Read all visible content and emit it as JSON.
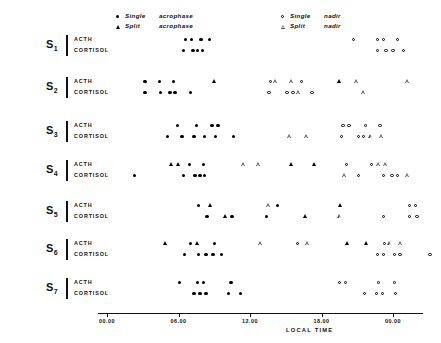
{
  "chart_data": {
    "type": "scatter",
    "title": "",
    "xlabel": "LOCAL TIME",
    "ylabel": "",
    "grid": false,
    "xlim": [
      0,
      30
    ],
    "x_ticks": [
      {
        "value": 0,
        "label": "00.00"
      },
      {
        "value": 6,
        "label": "06.00"
      },
      {
        "value": 12,
        "label": "12.00"
      },
      {
        "value": 18,
        "label": "18.00"
      },
      {
        "value": 24,
        "label": "00.00"
      }
    ],
    "legend": {
      "position": "top",
      "entries": [
        {
          "marker": "filled-circle",
          "kind": "Single",
          "type": "acrophase"
        },
        {
          "marker": "filled-triangle",
          "kind": "Split",
          "type": "acrophase"
        },
        {
          "marker": "open-circle",
          "kind": "Single",
          "type": "nadir"
        },
        {
          "marker": "open-triangle",
          "kind": "Split",
          "type": "nadir"
        }
      ]
    },
    "subjects": [
      {
        "id": "S1",
        "label": "S",
        "index": "1",
        "rows": [
          {
            "name": "ACTH",
            "points": [
              {
                "x": 6.6,
                "marker": "filled-circle"
              },
              {
                "x": 7.1,
                "marker": "filled-circle"
              },
              {
                "x": 7.9,
                "marker": "filled-circle"
              },
              {
                "x": 8.6,
                "marker": "filled-circle"
              },
              {
                "x": 20.7,
                "marker": "open-circle"
              },
              {
                "x": 22.7,
                "marker": "open-circle"
              },
              {
                "x": 23.2,
                "marker": "open-circle"
              },
              {
                "x": 24.4,
                "marker": "open-circle"
              }
            ]
          },
          {
            "name": "CORTISOL",
            "points": [
              {
                "x": 6.4,
                "marker": "filled-circle"
              },
              {
                "x": 7.2,
                "marker": "filled-circle"
              },
              {
                "x": 7.6,
                "marker": "filled-circle"
              },
              {
                "x": 8.0,
                "marker": "filled-circle"
              },
              {
                "x": 22.7,
                "marker": "open-circle"
              },
              {
                "x": 23.4,
                "marker": "open-circle"
              },
              {
                "x": 24.0,
                "marker": "open-circle"
              },
              {
                "x": 24.9,
                "marker": "open-circle"
              }
            ]
          }
        ]
      },
      {
        "id": "S2",
        "label": "S",
        "index": "2",
        "rows": [
          {
            "name": "ACTH",
            "points": [
              {
                "x": 3.2,
                "marker": "filled-circle"
              },
              {
                "x": 4.4,
                "marker": "filled-circle"
              },
              {
                "x": 5.6,
                "marker": "filled-circle"
              },
              {
                "x": 9.0,
                "marker": "filled-triangle"
              },
              {
                "x": 13.7,
                "marker": "open-circle"
              },
              {
                "x": 14.2,
                "marker": "open-triangle"
              },
              {
                "x": 15.5,
                "marker": "open-triangle"
              },
              {
                "x": 16.3,
                "marker": "open-circle"
              },
              {
                "x": 19.5,
                "marker": "filled-triangle"
              },
              {
                "x": 21.0,
                "marker": "open-triangle"
              },
              {
                "x": 25.3,
                "marker": "open-triangle"
              }
            ]
          },
          {
            "name": "CORTISOL",
            "points": [
              {
                "x": 3.2,
                "marker": "filled-circle"
              },
              {
                "x": 4.5,
                "marker": "filled-circle"
              },
              {
                "x": 5.3,
                "marker": "filled-circle"
              },
              {
                "x": 5.7,
                "marker": "filled-circle"
              },
              {
                "x": 7.0,
                "marker": "filled-circle"
              },
              {
                "x": 13.6,
                "marker": "open-circle"
              },
              {
                "x": 15.1,
                "marker": "open-circle"
              },
              {
                "x": 15.6,
                "marker": "open-circle"
              },
              {
                "x": 16.1,
                "marker": "open-triangle"
              },
              {
                "x": 17.2,
                "marker": "open-circle"
              },
              {
                "x": 21.6,
                "marker": "open-triangle"
              }
            ]
          }
        ]
      },
      {
        "id": "S3",
        "label": "S",
        "index": "3",
        "rows": [
          {
            "name": "ACTH",
            "points": [
              {
                "x": 5.9,
                "marker": "filled-circle"
              },
              {
                "x": 7.5,
                "marker": "filled-circle"
              },
              {
                "x": 8.8,
                "marker": "filled-circle"
              },
              {
                "x": 9.3,
                "marker": "filled-circle"
              },
              {
                "x": 19.8,
                "marker": "open-circle"
              },
              {
                "x": 20.3,
                "marker": "open-circle"
              },
              {
                "x": 21.7,
                "marker": "open-circle"
              },
              {
                "x": 22.9,
                "marker": "open-circle"
              }
            ]
          },
          {
            "name": "CORTISOL",
            "points": [
              {
                "x": 5.1,
                "marker": "filled-circle"
              },
              {
                "x": 6.3,
                "marker": "filled-circle"
              },
              {
                "x": 7.3,
                "marker": "filled-circle"
              },
              {
                "x": 8.2,
                "marker": "filled-circle"
              },
              {
                "x": 9.1,
                "marker": "filled-circle"
              },
              {
                "x": 10.6,
                "marker": "filled-circle"
              },
              {
                "x": 15.4,
                "marker": "open-triangle"
              },
              {
                "x": 16.8,
                "marker": "open-triangle"
              },
              {
                "x": 19.7,
                "marker": "open-circle"
              },
              {
                "x": 21.1,
                "marker": "open-circle"
              },
              {
                "x": 21.5,
                "marker": "open-circle"
              },
              {
                "x": 22.2,
                "marker": "open-triangle"
              },
              {
                "x": 23.1,
                "marker": "open-triangle"
              }
            ]
          }
        ]
      },
      {
        "id": "S4",
        "label": "S",
        "index": "4",
        "rows": [
          {
            "name": "ACTH",
            "points": [
              {
                "x": 5.4,
                "marker": "filled-triangle"
              },
              {
                "x": 6.0,
                "marker": "filled-triangle"
              },
              {
                "x": 6.9,
                "marker": "filled-circle"
              },
              {
                "x": 8.1,
                "marker": "filled-circle"
              },
              {
                "x": 11.5,
                "marker": "open-triangle"
              },
              {
                "x": 12.8,
                "marker": "open-triangle"
              },
              {
                "x": 15.5,
                "marker": "filled-triangle"
              },
              {
                "x": 17.4,
                "marker": "filled-triangle"
              },
              {
                "x": 20.1,
                "marker": "open-circle"
              },
              {
                "x": 22.2,
                "marker": "open-circle"
              },
              {
                "x": 22.8,
                "marker": "open-triangle"
              },
              {
                "x": 23.4,
                "marker": "open-triangle"
              }
            ]
          },
          {
            "name": "CORTISOL",
            "points": [
              {
                "x": 2.3,
                "marker": "filled-circle"
              },
              {
                "x": 6.4,
                "marker": "filled-circle"
              },
              {
                "x": 7.4,
                "marker": "filled-circle"
              },
              {
                "x": 7.8,
                "marker": "filled-circle"
              },
              {
                "x": 8.2,
                "marker": "filled-circle"
              },
              {
                "x": 20.0,
                "marker": "open-triangle"
              },
              {
                "x": 21.1,
                "marker": "open-circle"
              },
              {
                "x": 23.2,
                "marker": "open-circle"
              },
              {
                "x": 23.9,
                "marker": "open-circle"
              },
              {
                "x": 24.4,
                "marker": "open-circle"
              },
              {
                "x": 25.3,
                "marker": "open-triangle"
              }
            ]
          }
        ]
      },
      {
        "id": "S5",
        "label": "S",
        "index": "5",
        "rows": [
          {
            "name": "ACTH",
            "points": [
              {
                "x": 7.7,
                "marker": "filled-circle"
              },
              {
                "x": 8.7,
                "marker": "filled-triangle"
              },
              {
                "x": 13.6,
                "marker": "open-triangle"
              },
              {
                "x": 14.3,
                "marker": "filled-circle"
              },
              {
                "x": 19.6,
                "marker": "filled-triangle"
              },
              {
                "x": 25.4,
                "marker": "open-circle"
              },
              {
                "x": 25.9,
                "marker": "open-circle"
              }
            ]
          },
          {
            "name": "CORTISOL",
            "points": [
              {
                "x": 8.4,
                "marker": "filled-circle"
              },
              {
                "x": 9.9,
                "marker": "filled-triangle"
              },
              {
                "x": 10.5,
                "marker": "filled-circle"
              },
              {
                "x": 13.4,
                "marker": "filled-circle"
              },
              {
                "x": 16.6,
                "marker": "filled-triangle"
              },
              {
                "x": 19.6,
                "marker": "open-triangle"
              },
              {
                "x": 23.2,
                "marker": "open-circle"
              },
              {
                "x": 25.4,
                "marker": "open-circle"
              },
              {
                "x": 26.0,
                "marker": "open-circle"
              }
            ]
          }
        ]
      },
      {
        "id": "S6",
        "label": "S",
        "index": "6",
        "rows": [
          {
            "name": "ACTH",
            "points": [
              {
                "x": 4.9,
                "marker": "filled-triangle"
              },
              {
                "x": 7.0,
                "marker": "filled-circle"
              },
              {
                "x": 7.6,
                "marker": "filled-triangle"
              },
              {
                "x": 9.0,
                "marker": "filled-circle"
              },
              {
                "x": 12.9,
                "marker": "open-triangle"
              },
              {
                "x": 16.0,
                "marker": "open-circle"
              },
              {
                "x": 16.9,
                "marker": "open-triangle"
              },
              {
                "x": 20.2,
                "marker": "filled-triangle"
              },
              {
                "x": 21.8,
                "marker": "filled-triangle"
              },
              {
                "x": 23.3,
                "marker": "open-circle"
              },
              {
                "x": 23.8,
                "marker": "open-triangle"
              },
              {
                "x": 24.7,
                "marker": "open-triangle"
              }
            ]
          },
          {
            "name": "CORTISOL",
            "points": [
              {
                "x": 6.5,
                "marker": "filled-circle"
              },
              {
                "x": 7.7,
                "marker": "filled-circle"
              },
              {
                "x": 8.3,
                "marker": "filled-circle"
              },
              {
                "x": 8.9,
                "marker": "filled-circle"
              },
              {
                "x": 9.6,
                "marker": "filled-circle"
              },
              {
                "x": 22.7,
                "marker": "open-circle"
              },
              {
                "x": 23.2,
                "marker": "open-circle"
              },
              {
                "x": 24.1,
                "marker": "open-circle"
              },
              {
                "x": 24.6,
                "marker": "open-circle"
              },
              {
                "x": 27.1,
                "marker": "open-circle"
              }
            ]
          }
        ]
      },
      {
        "id": "S7",
        "label": "S",
        "index": "7",
        "rows": [
          {
            "name": "ACTH",
            "points": [
              {
                "x": 6.1,
                "marker": "filled-circle"
              },
              {
                "x": 7.6,
                "marker": "filled-circle"
              },
              {
                "x": 8.1,
                "marker": "filled-circle"
              },
              {
                "x": 10.4,
                "marker": "filled-circle"
              },
              {
                "x": 19.5,
                "marker": "open-circle"
              },
              {
                "x": 20.0,
                "marker": "open-circle"
              },
              {
                "x": 22.8,
                "marker": "open-circle"
              },
              {
                "x": 24.1,
                "marker": "open-circle"
              }
            ]
          },
          {
            "name": "CORTISOL",
            "points": [
              {
                "x": 7.3,
                "marker": "filled-circle"
              },
              {
                "x": 7.8,
                "marker": "filled-circle"
              },
              {
                "x": 8.3,
                "marker": "filled-circle"
              },
              {
                "x": 10.2,
                "marker": "filled-circle"
              },
              {
                "x": 11.2,
                "marker": "filled-circle"
              },
              {
                "x": 21.6,
                "marker": "open-circle"
              },
              {
                "x": 22.6,
                "marker": "open-circle"
              },
              {
                "x": 23.1,
                "marker": "open-circle"
              },
              {
                "x": 24.2,
                "marker": "open-circle"
              }
            ]
          }
        ]
      }
    ]
  }
}
